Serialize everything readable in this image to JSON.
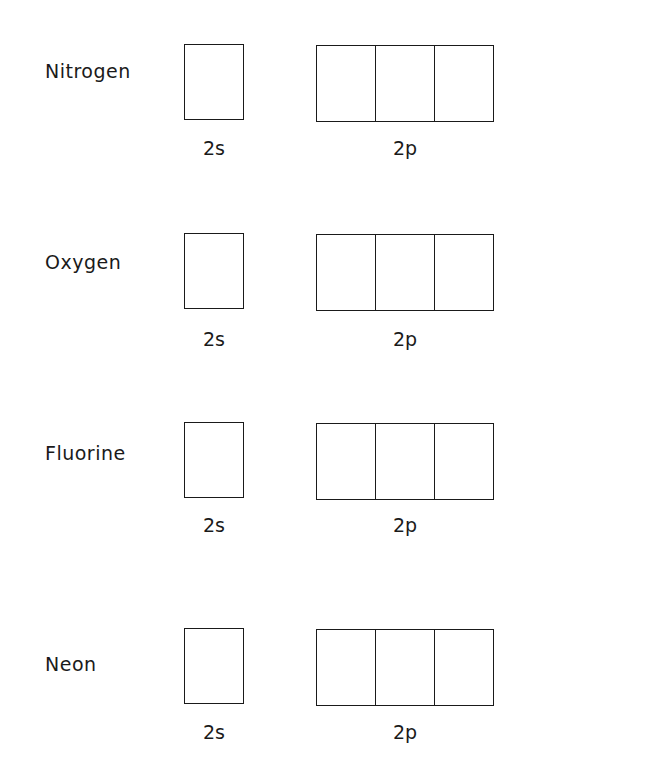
{
  "rows": [
    {
      "element": "Nitrogen",
      "s_label": "2s",
      "p_label": "2p",
      "top": 44,
      "label_top": 60,
      "sub_top": 137
    },
    {
      "element": "Oxygen",
      "s_label": "2s",
      "p_label": "2p",
      "top": 233,
      "label_top": 251,
      "sub_top": 328
    },
    {
      "element": "Fluorine",
      "s_label": "2s",
      "p_label": "2p",
      "top": 422,
      "label_top": 442,
      "sub_top": 514
    },
    {
      "element": "Neon",
      "s_label": "2s",
      "p_label": "2p",
      "top": 628,
      "label_top": 653,
      "sub_top": 721
    }
  ],
  "colors": {
    "line": "#1a1a1a",
    "background": "#ffffff"
  }
}
